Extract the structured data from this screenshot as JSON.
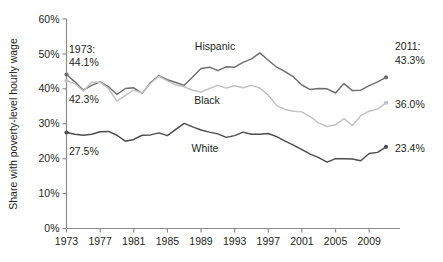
{
  "chart_data": {
    "type": "line",
    "title": "",
    "xlabel": "",
    "ylabel": "Share with poverty-level hourly wage",
    "xlim": [
      1973,
      2011
    ],
    "ylim": [
      0,
      60
    ],
    "grid": false,
    "legend_position": "inline-labels",
    "x": [
      1973,
      1974,
      1975,
      1976,
      1977,
      1978,
      1979,
      1980,
      1981,
      1982,
      1983,
      1984,
      1985,
      1986,
      1987,
      1988,
      1989,
      1990,
      1991,
      1992,
      1993,
      1994,
      1995,
      1996,
      1997,
      1998,
      1999,
      2000,
      2001,
      2002,
      2003,
      2004,
      2005,
      2006,
      2007,
      2008,
      2009,
      2010,
      2011
    ],
    "xticks": [
      "1973",
      "1977",
      "1981",
      "1985",
      "1989",
      "1993",
      "1997",
      "2001",
      "2005",
      "2009"
    ],
    "yticks": [
      "0%",
      "10%",
      "20%",
      "30%",
      "40%",
      "50%",
      "60%"
    ],
    "series": [
      {
        "name": "Hispanic",
        "color": "#6e6e6e",
        "values": [
          44.1,
          42.0,
          39.6,
          41.0,
          42.0,
          40.6,
          38.4,
          40.1,
          40.3,
          38.7,
          41.8,
          43.8,
          42.6,
          41.8,
          41.0,
          43.4,
          45.8,
          46.2,
          45.2,
          46.3,
          46.2,
          47.6,
          48.6,
          50.3,
          48.2,
          46.2,
          44.9,
          43.4,
          41.1,
          39.8,
          40.1,
          40.0,
          38.8,
          41.5,
          39.5,
          39.6,
          40.9,
          42.0,
          43.3
        ]
      },
      {
        "name": "Black",
        "color": "#c2c2c2",
        "values": [
          42.3,
          41.5,
          39.4,
          41.9,
          41.9,
          40.1,
          36.5,
          38.1,
          39.6,
          38.8,
          41.6,
          43.6,
          42.3,
          41.1,
          40.6,
          39.6,
          39.1,
          40.1,
          41.0,
          40.2,
          40.9,
          40.3,
          41.0,
          40.2,
          38.2,
          35.2,
          34.1,
          33.6,
          33.4,
          32.0,
          30.2,
          29.2,
          29.7,
          31.5,
          29.5,
          32.3,
          33.6,
          34.2,
          36.0
        ]
      },
      {
        "name": "White",
        "color": "#4d4d4d",
        "values": [
          27.5,
          27.0,
          26.7,
          27.0,
          27.7,
          27.8,
          26.7,
          25.0,
          25.5,
          26.7,
          26.8,
          27.4,
          26.6,
          28.4,
          30.1,
          29.1,
          28.2,
          27.6,
          27.1,
          26.1,
          26.6,
          27.6,
          27.0,
          27.0,
          27.2,
          26.3,
          25.0,
          23.9,
          22.6,
          21.3,
          20.3,
          19.0,
          20.0,
          20.0,
          19.9,
          19.4,
          21.5,
          21.8,
          23.4
        ]
      }
    ],
    "annotations": {
      "left_year_label": "1973:",
      "left_hispanic_value": "44.1%",
      "left_black_value": "42.3%",
      "left_white_value": "27.5%",
      "right_year_label": "2011:",
      "right_hispanic_value": "43.3%",
      "right_black_value": "36.0%",
      "right_white_value": "23.4%"
    }
  }
}
